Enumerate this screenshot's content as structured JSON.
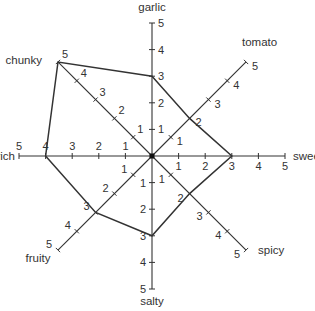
{
  "chart_data": {
    "type": "radar",
    "title": "",
    "axes": [
      "garlic",
      "tomato",
      "sweet",
      "spicy",
      "salty",
      "fruity",
      "rich",
      "chunky"
    ],
    "range": [
      0,
      5
    ],
    "ticks": [
      1,
      2,
      3,
      4,
      5
    ],
    "grid": false,
    "legend": null,
    "series": [
      {
        "name": "profile",
        "values": [
          3,
          2,
          3,
          2,
          3,
          3,
          4,
          5
        ]
      }
    ],
    "colors": {
      "line": "#333333",
      "axis": "#333333",
      "text": "#333333"
    }
  }
}
